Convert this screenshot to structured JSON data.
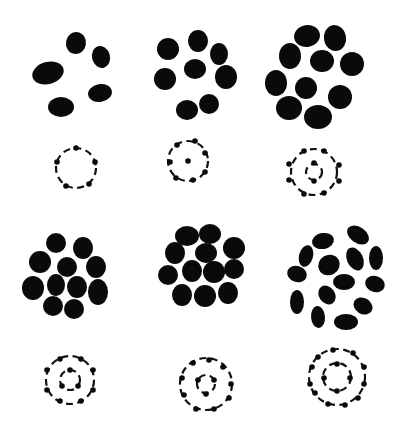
{
  "figure": {
    "background": "#ffffff",
    "ink": "#0a0a0a",
    "panels": [
      {
        "id": "panel-1",
        "blob_count": 5,
        "blobs": [
          {
            "cx": 76,
            "cy": 43,
            "rx": 10,
            "ry": 11,
            "rot": 10
          },
          {
            "cx": 101,
            "cy": 57,
            "rx": 9,
            "ry": 11,
            "rot": -15
          },
          {
            "cx": 48,
            "cy": 73,
            "rx": 16,
            "ry": 11,
            "rot": -15
          },
          {
            "cx": 100,
            "cy": 93,
            "rx": 12,
            "ry": 9,
            "rot": -10
          },
          {
            "cx": 61,
            "cy": 107,
            "rx": 13,
            "ry": 10,
            "rot": 0
          }
        ],
        "atom": {
          "cx": 76,
          "cy": 168,
          "shells": [
            20
          ],
          "electrons": [
            [
              76,
              148
            ],
            [
              95,
              162
            ],
            [
              89,
              184
            ],
            [
              66,
              186
            ],
            [
              57,
              162
            ]
          ],
          "nucleus": false
        }
      },
      {
        "id": "panel-2",
        "blob_count": 8,
        "blobs": [
          {
            "cx": 198,
            "cy": 41,
            "rx": 10,
            "ry": 11,
            "rot": 0
          },
          {
            "cx": 168,
            "cy": 49,
            "rx": 11,
            "ry": 11,
            "rot": 0
          },
          {
            "cx": 219,
            "cy": 54,
            "rx": 9,
            "ry": 11,
            "rot": 0
          },
          {
            "cx": 195,
            "cy": 69,
            "rx": 11,
            "ry": 10,
            "rot": 0
          },
          {
            "cx": 165,
            "cy": 79,
            "rx": 11,
            "ry": 11,
            "rot": 0
          },
          {
            "cx": 226,
            "cy": 77,
            "rx": 11,
            "ry": 12,
            "rot": 0
          },
          {
            "cx": 187,
            "cy": 110,
            "rx": 11,
            "ry": 10,
            "rot": 0
          },
          {
            "cx": 209,
            "cy": 104,
            "rx": 10,
            "ry": 10,
            "rot": 0
          }
        ],
        "atom": {
          "cx": 188,
          "cy": 161,
          "shells": [
            20
          ],
          "electrons": [
            [
              177,
              145
            ],
            [
              195,
              141
            ],
            [
              205,
              153
            ],
            [
              170,
              162
            ],
            [
              205,
              172
            ],
            [
              176,
              178
            ],
            [
              193,
              180
            ]
          ],
          "nucleus": [
            188,
            161
          ]
        }
      },
      {
        "id": "panel-3",
        "blob_count": 10,
        "blobs": [
          {
            "cx": 307,
            "cy": 36,
            "rx": 13,
            "ry": 11,
            "rot": -10
          },
          {
            "cx": 335,
            "cy": 38,
            "rx": 11,
            "ry": 13,
            "rot": -10
          },
          {
            "cx": 290,
            "cy": 56,
            "rx": 11,
            "ry": 13,
            "rot": 0
          },
          {
            "cx": 322,
            "cy": 61,
            "rx": 12,
            "ry": 11,
            "rot": 0
          },
          {
            "cx": 352,
            "cy": 64,
            "rx": 12,
            "ry": 12,
            "rot": 0
          },
          {
            "cx": 276,
            "cy": 83,
            "rx": 11,
            "ry": 13,
            "rot": 0
          },
          {
            "cx": 306,
            "cy": 88,
            "rx": 11,
            "ry": 11,
            "rot": 0
          },
          {
            "cx": 340,
            "cy": 97,
            "rx": 12,
            "ry": 12,
            "rot": 0
          },
          {
            "cx": 289,
            "cy": 108,
            "rx": 13,
            "ry": 12,
            "rot": 0
          },
          {
            "cx": 318,
            "cy": 117,
            "rx": 14,
            "ry": 12,
            "rot": 0
          }
        ],
        "atom": {
          "cx": 314,
          "cy": 172,
          "shells": [
            23,
            8
          ],
          "electrons": [
            [
              304,
              151
            ],
            [
              324,
              151
            ],
            [
              289,
              164
            ],
            [
              339,
              165
            ],
            [
              289,
              180
            ],
            [
              339,
              181
            ],
            [
              304,
              194
            ],
            [
              324,
              193
            ],
            [
              314,
              163
            ],
            [
              314,
              181
            ]
          ],
          "nucleus": false
        }
      },
      {
        "id": "panel-4",
        "blob_count": 11,
        "blobs": [
          {
            "cx": 56,
            "cy": 243,
            "rx": 10,
            "ry": 10,
            "rot": 0
          },
          {
            "cx": 83,
            "cy": 248,
            "rx": 10,
            "ry": 11,
            "rot": 0
          },
          {
            "cx": 40,
            "cy": 262,
            "rx": 11,
            "ry": 11,
            "rot": 0
          },
          {
            "cx": 67,
            "cy": 267,
            "rx": 10,
            "ry": 10,
            "rot": 0
          },
          {
            "cx": 96,
            "cy": 267,
            "rx": 10,
            "ry": 11,
            "rot": 0
          },
          {
            "cx": 33,
            "cy": 288,
            "rx": 11,
            "ry": 12,
            "rot": 0
          },
          {
            "cx": 56,
            "cy": 285,
            "rx": 9,
            "ry": 11,
            "rot": 0
          },
          {
            "cx": 77,
            "cy": 287,
            "rx": 10,
            "ry": 11,
            "rot": 0
          },
          {
            "cx": 98,
            "cy": 292,
            "rx": 10,
            "ry": 13,
            "rot": 0
          },
          {
            "cx": 53,
            "cy": 306,
            "rx": 10,
            "ry": 10,
            "rot": 0
          },
          {
            "cx": 74,
            "cy": 309,
            "rx": 10,
            "ry": 10,
            "rot": 0
          }
        ],
        "atom": {
          "cx": 70,
          "cy": 380,
          "shells": [
            24,
            10
          ],
          "electrons": [
            [
              60,
              359
            ],
            [
              81,
              359
            ],
            [
              47,
              370
            ],
            [
              93,
              370
            ],
            [
              47,
              390
            ],
            [
              93,
              390
            ],
            [
              60,
              401
            ],
            [
              81,
              401
            ],
            [
              70,
              370
            ],
            [
              62,
              386
            ],
            [
              78,
              386
            ]
          ],
          "nucleus": false
        }
      },
      {
        "id": "panel-5",
        "blob_count": 12,
        "blobs": [
          {
            "cx": 187,
            "cy": 236,
            "rx": 12,
            "ry": 10,
            "rot": 0
          },
          {
            "cx": 210,
            "cy": 234,
            "rx": 11,
            "ry": 10,
            "rot": 0
          },
          {
            "cx": 175,
            "cy": 253,
            "rx": 10,
            "ry": 11,
            "rot": 0
          },
          {
            "cx": 206,
            "cy": 253,
            "rx": 11,
            "ry": 10,
            "rot": 0
          },
          {
            "cx": 234,
            "cy": 248,
            "rx": 11,
            "ry": 11,
            "rot": 0
          },
          {
            "cx": 168,
            "cy": 275,
            "rx": 10,
            "ry": 10,
            "rot": 0
          },
          {
            "cx": 192,
            "cy": 271,
            "rx": 10,
            "ry": 11,
            "rot": 0
          },
          {
            "cx": 214,
            "cy": 272,
            "rx": 11,
            "ry": 11,
            "rot": 0
          },
          {
            "cx": 234,
            "cy": 269,
            "rx": 10,
            "ry": 10,
            "rot": 0
          },
          {
            "cx": 182,
            "cy": 295,
            "rx": 10,
            "ry": 11,
            "rot": 0
          },
          {
            "cx": 205,
            "cy": 296,
            "rx": 11,
            "ry": 11,
            "rot": 0
          },
          {
            "cx": 228,
            "cy": 293,
            "rx": 10,
            "ry": 11,
            "rot": 0
          }
        ],
        "atom": {
          "cx": 206,
          "cy": 384,
          "shells": [
            26,
            9
          ],
          "electrons": [
            [
              193,
              363
            ],
            [
              209,
              360
            ],
            [
              223,
              367
            ],
            [
              182,
              378
            ],
            [
              231,
              384
            ],
            [
              184,
              395
            ],
            [
              229,
              398
            ],
            [
              196,
              409
            ],
            [
              214,
              409
            ],
            [
              198,
              380
            ],
            [
              214,
              380
            ],
            [
              206,
              394
            ]
          ],
          "nucleus": false
        }
      },
      {
        "id": "panel-6",
        "blob_count": 14,
        "blobs": [
          {
            "cx": 323,
            "cy": 241,
            "rx": 11,
            "ry": 8,
            "rot": -10
          },
          {
            "cx": 358,
            "cy": 235,
            "rx": 12,
            "ry": 8,
            "rot": 35
          },
          {
            "cx": 306,
            "cy": 256,
            "rx": 7,
            "ry": 11,
            "rot": 15
          },
          {
            "cx": 355,
            "cy": 259,
            "rx": 8,
            "ry": 12,
            "rot": -25
          },
          {
            "cx": 376,
            "cy": 258,
            "rx": 7,
            "ry": 12,
            "rot": 0
          },
          {
            "cx": 329,
            "cy": 265,
            "rx": 11,
            "ry": 10,
            "rot": -30
          },
          {
            "cx": 297,
            "cy": 274,
            "rx": 10,
            "ry": 8,
            "rot": 20
          },
          {
            "cx": 344,
            "cy": 282,
            "rx": 11,
            "ry": 8,
            "rot": 0
          },
          {
            "cx": 375,
            "cy": 284,
            "rx": 10,
            "ry": 8,
            "rot": 20
          },
          {
            "cx": 327,
            "cy": 295,
            "rx": 8,
            "ry": 10,
            "rot": -35
          },
          {
            "cx": 297,
            "cy": 302,
            "rx": 7,
            "ry": 12,
            "rot": 0
          },
          {
            "cx": 363,
            "cy": 306,
            "rx": 10,
            "ry": 8,
            "rot": 30
          },
          {
            "cx": 318,
            "cy": 317,
            "rx": 7,
            "ry": 11,
            "rot": -5
          },
          {
            "cx": 346,
            "cy": 322,
            "rx": 12,
            "ry": 8,
            "rot": 0
          }
        ],
        "atom": {
          "cx": 337,
          "cy": 377,
          "shells": [
            28,
            14
          ],
          "electrons": [
            [
              318,
              357
            ],
            [
              333,
              350
            ],
            [
              353,
              353
            ],
            [
              312,
              367
            ],
            [
              364,
              367
            ],
            [
              310,
              384
            ],
            [
              364,
              384
            ],
            [
              315,
              393
            ],
            [
              358,
              398
            ],
            [
              328,
              404
            ],
            [
              345,
              405
            ],
            [
              337,
              364
            ],
            [
              324,
              378
            ],
            [
              350,
              378
            ],
            [
              337,
              391
            ]
          ],
          "nucleus": false
        }
      }
    ]
  }
}
